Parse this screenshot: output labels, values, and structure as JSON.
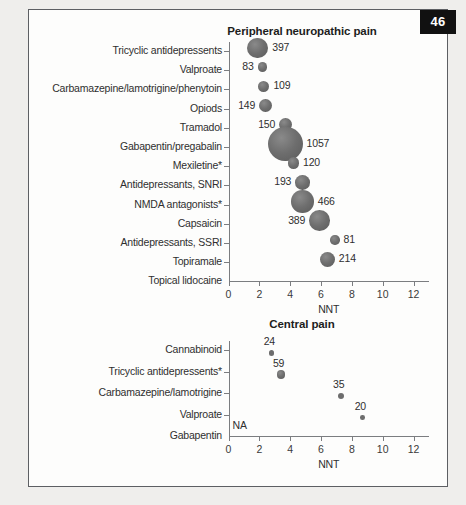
{
  "page": {
    "number_badge": "46",
    "background_color": "#efeeec",
    "sheet_color": "#fdfdfc",
    "border_color": "#5d5f63",
    "badge_bg_color": "#111111",
    "badge_text_color": "#ffffff",
    "bubble_color": "#6d6d6d"
  },
  "chart_data": [
    {
      "id": "peripheral",
      "type": "scatter",
      "title": "Peripheral neuropathic pain",
      "xlabel": "NNT",
      "ylabel": "",
      "xlim": [
        0,
        13
      ],
      "xticks": [
        0,
        2,
        4,
        6,
        8,
        10,
        12
      ],
      "xticklabels": [
        "0",
        "2",
        "4",
        "6",
        "8",
        "10",
        "12"
      ],
      "grid": false,
      "legend": null,
      "categories": [
        "Tricyclic antidepressents",
        "Valproate",
        "Carbamazepine/lamotrigine/phenytoin",
        "Opiods",
        "Tramadol",
        "Gabapentin/pregabalin",
        "Mexiletine*",
        "Antidepressants, SNRI",
        "NMDA antagonists*",
        "Capsaicin",
        "Antidepressants, SSRI",
        "Topiramale",
        "Topical lidocaine"
      ],
      "points": [
        {
          "category": "Tricyclic antidepressents",
          "nnt": 1.9,
          "n": 397,
          "label": "397",
          "label_side": "right"
        },
        {
          "category": "Valproate",
          "nnt": 2.2,
          "n": 83,
          "label": "83",
          "label_side": "left"
        },
        {
          "category": "Carbamazepine/lamotrigine/phenytoin",
          "nnt": 2.3,
          "n": 109,
          "label": "109",
          "label_side": "right"
        },
        {
          "category": "Opiods",
          "nnt": 2.4,
          "n": 149,
          "label": "149",
          "label_side": "left"
        },
        {
          "category": "Tramadol",
          "nnt": 3.7,
          "n": 150,
          "label": "150",
          "label_side": "left"
        },
        {
          "category": "Gabapentin/pregabalin",
          "nnt": 3.7,
          "n": 1057,
          "label": "1057",
          "label_side": "right"
        },
        {
          "category": "Mexiletine*",
          "nnt": 4.2,
          "n": 120,
          "label": "120",
          "label_side": "right"
        },
        {
          "category": "Antidepressants, SNRI",
          "nnt": 4.8,
          "n": 193,
          "label": "193",
          "label_side": "left"
        },
        {
          "category": "NMDA antagonists*",
          "nnt": 4.8,
          "n": 466,
          "label": "466",
          "label_side": "right"
        },
        {
          "category": "Capsaicin",
          "nnt": 5.9,
          "n": 389,
          "label": "389",
          "label_side": "left"
        },
        {
          "category": "Antidepressants, SSRI",
          "nnt": 6.9,
          "n": 81,
          "label": "81",
          "label_side": "right"
        },
        {
          "category": "Topiramale",
          "nnt": 6.4,
          "n": 214,
          "label": "214",
          "label_side": "right"
        },
        {
          "category": "Topical lidocaine",
          "nnt": null,
          "n": null,
          "label": "",
          "label_side": "right"
        }
      ]
    },
    {
      "id": "central",
      "type": "scatter",
      "title": "Central pain",
      "xlabel": "NNT",
      "ylabel": "",
      "xlim": [
        0,
        13
      ],
      "xticks": [
        0,
        2,
        4,
        6,
        8,
        10,
        12
      ],
      "xticklabels": [
        "0",
        "2",
        "4",
        "6",
        "8",
        "10",
        "12"
      ],
      "grid": false,
      "legend": null,
      "na_label": "NA",
      "categories": [
        "Cannabinoid",
        "Tricyclic antidepressents*",
        "Carbamazepine/lamotrigine",
        "Valproate",
        "Gabapentin"
      ],
      "points": [
        {
          "category": "Cannabinoid",
          "nnt": 2.8,
          "n": 24,
          "label": "24",
          "label_side": "above"
        },
        {
          "category": "Tricyclic antidepressents*",
          "nnt": 3.4,
          "n": 59,
          "label": "59",
          "label_side": "above"
        },
        {
          "category": "Carbamazepine/lamotrigine",
          "nnt": 7.3,
          "n": 35,
          "label": "35",
          "label_side": "above"
        },
        {
          "category": "Valproate",
          "nnt": 8.7,
          "n": 20,
          "label": "20",
          "label_side": "above"
        },
        {
          "category": "Gabapentin",
          "nnt": null,
          "n": null,
          "label": "NA",
          "label_side": "right"
        }
      ]
    }
  ]
}
